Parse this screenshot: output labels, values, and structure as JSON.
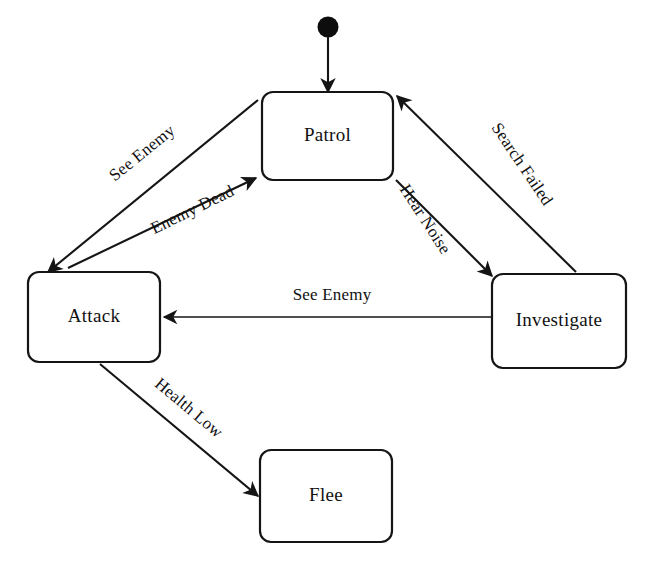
{
  "diagram": {
    "type": "state-machine",
    "background_color": "#ffffff",
    "stroke_color": "#151515",
    "text_color": "#111111",
    "canvas": {
      "width": 646,
      "height": 569
    }
  },
  "initial_marker": {
    "name": "initial-state",
    "cx": 328,
    "cy": 27,
    "r": 10,
    "target_state": "Patrol"
  },
  "states": [
    {
      "id": "patrol",
      "label": "Patrol",
      "x": 262,
      "y": 92,
      "w": 131,
      "h": 88,
      "cx": 327.5,
      "cy": 136
    },
    {
      "id": "attack",
      "label": "Attack",
      "x": 28,
      "y": 272,
      "w": 132,
      "h": 90,
      "cx": 94,
      "cy": 317
    },
    {
      "id": "investigate",
      "label": "Investigate",
      "x": 492,
      "y": 274,
      "w": 134,
      "h": 94,
      "cx": 559,
      "cy": 321
    },
    {
      "id": "flee",
      "label": "Flee",
      "x": 260,
      "y": 450,
      "w": 132,
      "h": 92,
      "cx": 326,
      "cy": 496
    }
  ],
  "transitions": [
    {
      "id": "patrol-to-attack",
      "label": "See Enemy",
      "from": "patrol",
      "to": "attack",
      "x1": 258,
      "y1": 100,
      "x2": 48,
      "y2": 272,
      "label_x": 143,
      "label_y": 154,
      "label_rotate": -39
    },
    {
      "id": "attack-to-patrol",
      "label": "Enemy Dead",
      "from": "attack",
      "to": "patrol",
      "x1": 68,
      "y1": 268,
      "x2": 256,
      "y2": 178,
      "label_x": 193,
      "label_y": 211,
      "label_rotate": -39
    },
    {
      "id": "patrol-to-investigate",
      "label": "Hear Noise",
      "from": "patrol",
      "to": "investigate",
      "x1": 396,
      "y1": 180,
      "x2": 492,
      "y2": 276,
      "label_x": 424,
      "label_y": 218,
      "label_rotate": 57
    },
    {
      "id": "investigate-to-patrol",
      "label": "Search Failed",
      "from": "investigate",
      "to": "patrol",
      "x1": 574,
      "y1": 272,
      "x2": 396,
      "y2": 96,
      "label_x": 520,
      "label_y": 164,
      "label_rotate": 55
    },
    {
      "id": "investigate-to-attack",
      "label": "See Enemy",
      "from": "investigate",
      "to": "attack",
      "x1": 492,
      "y1": 317,
      "x2": 164,
      "y2": 317,
      "label_x": 330,
      "label_y": 295,
      "label_rotate": 0
    },
    {
      "id": "attack-to-flee",
      "label": "Health Low",
      "from": "attack",
      "to": "flee",
      "x1": 100,
      "y1": 364,
      "x2": 258,
      "y2": 496,
      "label_x": 188,
      "label_y": 409,
      "label_rotate": 40
    }
  ]
}
